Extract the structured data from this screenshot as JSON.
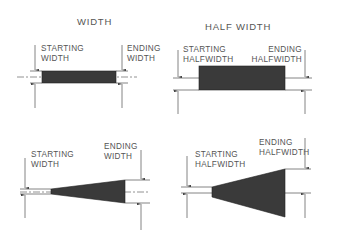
{
  "panels": [
    {
      "title": "WIDTH",
      "start_label": [
        "STARTING",
        "WIDTH"
      ],
      "end_label": [
        "ENDING",
        "WIDTH"
      ],
      "shape": "constant-width-segment"
    },
    {
      "title": "HALF WIDTH",
      "start_label": [
        "STARTING",
        "HALFWIDTH"
      ],
      "end_label": [
        "ENDING",
        "HALFWIDTH"
      ],
      "shape": "constant-halfwidth-segment"
    },
    {
      "title": "",
      "start_label": [
        "STARTING",
        "WIDTH"
      ],
      "end_label": [
        "ENDING",
        "WIDTH"
      ],
      "shape": "tapered-width-segment"
    },
    {
      "title": "",
      "start_label": [
        "STARTING",
        "HALFWIDTH"
      ],
      "end_label": [
        "ENDING",
        "HALFWIDTH"
      ],
      "shape": "tapered-halfwidth-segment"
    }
  ],
  "colors": {
    "fill": "#3a3a3a",
    "line": "#666666",
    "text": "#555555"
  }
}
